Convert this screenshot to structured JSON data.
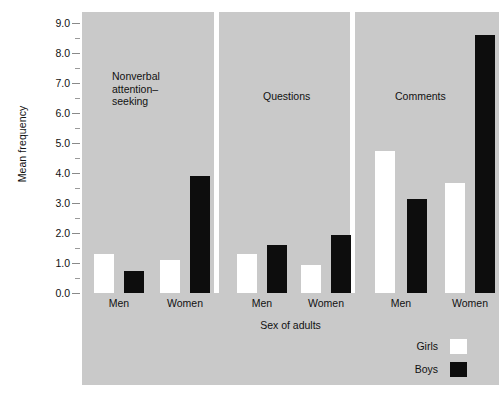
{
  "chart_data": {
    "type": "bar",
    "title": "",
    "xlabel": "Sex of adults",
    "ylabel": "Mean frequency",
    "ylim": [
      0.0,
      9.0
    ],
    "ytick_labels": [
      "0.0",
      "1.0",
      "2.0",
      "3.0",
      "4.0",
      "5.0",
      "6.0",
      "7.0",
      "8.0",
      "9.0"
    ],
    "ytick_values": [
      0.0,
      1.0,
      2.0,
      3.0,
      4.0,
      5.0,
      6.0,
      7.0,
      8.0,
      9.0
    ],
    "minor_ticks": [
      0.5,
      1.5,
      2.5,
      3.5,
      4.5,
      5.5,
      6.5,
      7.5,
      8.5
    ],
    "grid": false,
    "legend_position": "bottom-right",
    "panels": [
      {
        "title": "Nonverbal\nattention–\nseeking",
        "categories": [
          "Men",
          "Women"
        ],
        "series": [
          {
            "name": "Girls",
            "color": "#ffffff",
            "values": [
              1.3,
              1.1
            ]
          },
          {
            "name": "Boys",
            "color": "#0d0d0d",
            "values": [
              0.75,
              3.9
            ]
          }
        ]
      },
      {
        "title": "Questions",
        "categories": [
          "Men",
          "Women"
        ],
        "series": [
          {
            "name": "Girls",
            "color": "#ffffff",
            "values": [
              1.3,
              0.93
            ]
          },
          {
            "name": "Boys",
            "color": "#0d0d0d",
            "values": [
              1.6,
              1.93
            ]
          }
        ]
      },
      {
        "title": "Comments",
        "categories": [
          "Men",
          "Women"
        ],
        "series": [
          {
            "name": "Girls",
            "color": "#ffffff",
            "values": [
              4.73,
              3.67
            ]
          },
          {
            "name": "Boys",
            "color": "#0d0d0d",
            "values": [
              3.13,
              8.6
            ]
          }
        ]
      }
    ],
    "legend": [
      {
        "label": "Girls",
        "color": "#ffffff"
      },
      {
        "label": "Boys",
        "color": "#0d0d0d"
      }
    ],
    "panel_background": "#c9c9c9",
    "figure_background": "#ffffff"
  }
}
